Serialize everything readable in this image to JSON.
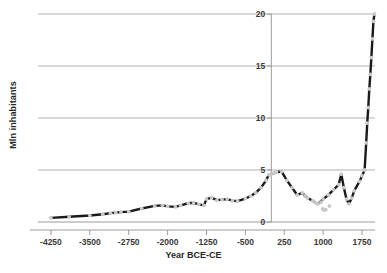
{
  "chart_data": {
    "type": "line",
    "title": "",
    "xlabel": "Year BCE-CE",
    "ylabel": "Mln inhabitants",
    "xlim": [
      -4500,
      2000
    ],
    "ylim": [
      0,
      20
    ],
    "xticks": [
      -4250,
      -3500,
      -2750,
      -2000,
      -1250,
      -500,
      250,
      1000,
      1750
    ],
    "yticks": [
      0,
      5,
      10,
      15,
      20
    ],
    "grid": "horizontal",
    "legend": "none",
    "series": [
      {
        "name": "Population",
        "marker": "circle",
        "marker_color": "#c9c9c9",
        "line_color": "#1a1a1a",
        "points": [
          {
            "x": -4250,
            "y": 0.4
          },
          {
            "x": -3900,
            "y": 0.5
          },
          {
            "x": -3500,
            "y": 0.62
          },
          {
            "x": -3250,
            "y": 0.75
          },
          {
            "x": -3100,
            "y": 0.85
          },
          {
            "x": -3000,
            "y": 0.9
          },
          {
            "x": -2900,
            "y": 0.95
          },
          {
            "x": -2750,
            "y": 1.0
          },
          {
            "x": -2500,
            "y": 1.3
          },
          {
            "x": -2250,
            "y": 1.55
          },
          {
            "x": -2100,
            "y": 1.6
          },
          {
            "x": -2000,
            "y": 1.5
          },
          {
            "x": -1850,
            "y": 1.45
          },
          {
            "x": -1750,
            "y": 1.6
          },
          {
            "x": -1600,
            "y": 1.8
          },
          {
            "x": -1500,
            "y": 1.85
          },
          {
            "x": -1400,
            "y": 1.7
          },
          {
            "x": -1300,
            "y": 1.6
          },
          {
            "x": -1250,
            "y": 2.2
          },
          {
            "x": -1150,
            "y": 2.35
          },
          {
            "x": -1050,
            "y": 2.1
          },
          {
            "x": -950,
            "y": 2.15
          },
          {
            "x": -850,
            "y": 2.2
          },
          {
            "x": -750,
            "y": 2.05
          },
          {
            "x": -650,
            "y": 2.0
          },
          {
            "x": -500,
            "y": 2.25
          },
          {
            "x": -400,
            "y": 2.5
          },
          {
            "x": -300,
            "y": 2.8
          },
          {
            "x": -200,
            "y": 3.3
          },
          {
            "x": -100,
            "y": 4.0
          },
          {
            "x": -50,
            "y": 4.55
          },
          {
            "x": 1,
            "y": 4.6
          },
          {
            "x": 50,
            "y": 4.7
          },
          {
            "x": 100,
            "y": 4.8
          },
          {
            "x": 200,
            "y": 4.85
          },
          {
            "x": 300,
            "y": 4.0
          },
          {
            "x": 400,
            "y": 3.3
          },
          {
            "x": 500,
            "y": 2.6
          },
          {
            "x": 600,
            "y": 2.8
          },
          {
            "x": 650,
            "y": 2.5
          },
          {
            "x": 700,
            "y": 2.3
          },
          {
            "x": 800,
            "y": 2.05
          },
          {
            "x": 850,
            "y": 1.85
          },
          {
            "x": 900,
            "y": 1.75
          },
          {
            "x": 1000,
            "y": 2.2
          },
          {
            "x": 1100,
            "y": 2.6
          },
          {
            "x": 1200,
            "y": 3.1
          },
          {
            "x": 1300,
            "y": 3.6
          },
          {
            "x": 1350,
            "y": 4.6
          },
          {
            "x": 1400,
            "y": 3.3
          },
          {
            "x": 1450,
            "y": 2.2
          },
          {
            "x": 1500,
            "y": 1.75
          },
          {
            "x": 1550,
            "y": 2.3
          },
          {
            "x": 1600,
            "y": 3.0
          },
          {
            "x": 1700,
            "y": 3.9
          },
          {
            "x": 1750,
            "y": 4.45
          },
          {
            "x": 1800,
            "y": 5.0
          },
          {
            "x": 1830,
            "y": 7.6
          },
          {
            "x": 1850,
            "y": 9.5
          },
          {
            "x": 1870,
            "y": 11.0
          },
          {
            "x": 1890,
            "y": 12.8
          },
          {
            "x": 1910,
            "y": 14.2
          },
          {
            "x": 1930,
            "y": 15.8
          },
          {
            "x": 1950,
            "y": 17.6
          },
          {
            "x": 1970,
            "y": 19.3
          },
          {
            "x": 1990,
            "y": 20.0
          }
        ]
      }
    ],
    "scatter_outliers": [
      {
        "x": 990,
        "y": 1.25
      },
      {
        "x": 1020,
        "y": 1.15
      },
      {
        "x": 1050,
        "y": 1.18
      },
      {
        "x": 1120,
        "y": 1.55
      },
      {
        "x": 960,
        "y": 1.9
      }
    ]
  },
  "colors": {
    "line": "#1a1a1a",
    "marker": "#c9c9c9",
    "grid": "#b3b3b3",
    "axis": "#9a9a9a",
    "text": "#262626",
    "background": "#ffffff"
  }
}
